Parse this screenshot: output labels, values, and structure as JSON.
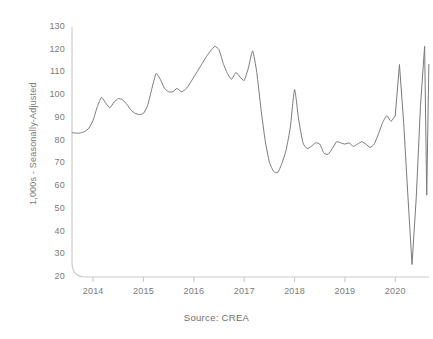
{
  "chart_data": {
    "type": "line",
    "title": "",
    "subtitle": "",
    "xlabel": "",
    "ylabel": "1,000s - Seasonally-Adjusted",
    "source": "Source: CREA",
    "grid": false,
    "legend": false,
    "legend_position": "none",
    "line_color": "#7a7a7a",
    "axis_color": "#c9c9c9",
    "text_color": "#7b7b7b",
    "background": "#ffffff",
    "xlim": [
      2013.58,
      2020.67
    ],
    "ylim": [
      20,
      130
    ],
    "y_ticks": [
      20,
      30,
      40,
      50,
      60,
      70,
      80,
      90,
      100,
      110,
      120,
      130
    ],
    "y_tick_labels": [
      "20",
      "30",
      "40",
      "50",
      "60",
      "70",
      "80",
      "90",
      "100",
      "110",
      "120",
      "130"
    ],
    "x_ticks": [
      2014,
      2015,
      2016,
      2017,
      2018,
      2019,
      2020
    ],
    "x_tick_labels": [
      "2014",
      "2015",
      "2016",
      "2017",
      "2018",
      "2019",
      "2020"
    ],
    "series": [
      {
        "name": "Home sales",
        "color": "#7a7a7a",
        "x": [
          2013.583,
          2013.667,
          2013.75,
          2013.833,
          2013.917,
          2014.0,
          2014.083,
          2014.167,
          2014.25,
          2014.333,
          2014.417,
          2014.5,
          2014.583,
          2014.667,
          2014.75,
          2014.833,
          2014.917,
          2015.0,
          2015.083,
          2015.167,
          2015.25,
          2015.333,
          2015.417,
          2015.5,
          2015.583,
          2015.667,
          2015.75,
          2015.833,
          2015.917,
          2016.0,
          2016.083,
          2016.167,
          2016.25,
          2016.333,
          2016.417,
          2016.5,
          2016.583,
          2016.667,
          2016.75,
          2016.833,
          2016.917,
          2017.0,
          2017.083,
          2017.167,
          2017.25,
          2017.333,
          2017.417,
          2017.5,
          2017.583,
          2017.667,
          2017.75,
          2017.833,
          2017.917,
          2018.0,
          2018.083,
          2018.167,
          2018.25,
          2018.333,
          2018.417,
          2018.5,
          2018.583,
          2018.667,
          2018.75,
          2018.833,
          2018.917,
          2019.0,
          2019.083,
          2019.167,
          2019.25,
          2019.333,
          2019.417,
          2019.5,
          2019.583,
          2019.667,
          2019.75,
          2019.833,
          2019.917,
          2020.0,
          2020.083,
          2020.167,
          2020.25,
          2020.333,
          2020.417,
          2020.5,
          2020.583,
          2020.625
        ],
        "values": [
          83.5,
          83.3,
          83.4,
          84.0,
          85.5,
          89.0,
          95.0,
          99.0,
          96.5,
          94.5,
          97.0,
          98.5,
          98.0,
          96.0,
          93.5,
          92.0,
          91.5,
          92.0,
          95.5,
          103.0,
          109.5,
          107.0,
          103.0,
          101.5,
          101.5,
          103.0,
          101.5,
          102.5,
          105.0,
          108.0,
          111.0,
          114.0,
          117.0,
          119.5,
          121.5,
          120.0,
          114.0,
          109.5,
          107.0,
          110.0,
          108.0,
          106.5,
          112.0,
          119.5,
          110.0,
          94.0,
          80.0,
          70.5,
          66.5,
          66.0,
          70.0,
          76.0,
          86.0,
          102.5,
          89.0,
          79.0,
          76.5,
          77.5,
          79.0,
          78.5,
          74.5,
          74.0,
          76.5,
          79.5,
          79.0,
          78.5,
          79.0,
          77.5,
          78.5,
          79.5,
          78.5,
          77.0,
          78.5,
          83.0,
          88.0,
          91.0,
          88.5,
          91.0,
          88.5,
          90.5,
          91.0,
          89.0,
          88.0,
          113.5,
          84.0,
          56.0
        ]
      }
    ],
    "annotations": [],
    "notable_points": {
      "start_value": 83.5,
      "peak_2016": 121.5,
      "trough_2017": 66.0,
      "spike_2017": 102.5,
      "pre_covid_spike": 113.5,
      "covid_trough": 25.5,
      "recovery_peak": 121.5,
      "end_value": 113.5
    },
    "covid_segment": {
      "x": [
        2020.083,
        2020.167,
        2020.25,
        2020.333,
        2020.417,
        2020.5,
        2020.583,
        2020.667
      ],
      "values": [
        113.5,
        88.0,
        56.0,
        25.5,
        55.0,
        95.0,
        121.5,
        113.5
      ]
    }
  },
  "axis": {
    "y_title": "1,000s - Seasonally-Adjusted"
  },
  "footer": {
    "source": "Source: CREA"
  }
}
